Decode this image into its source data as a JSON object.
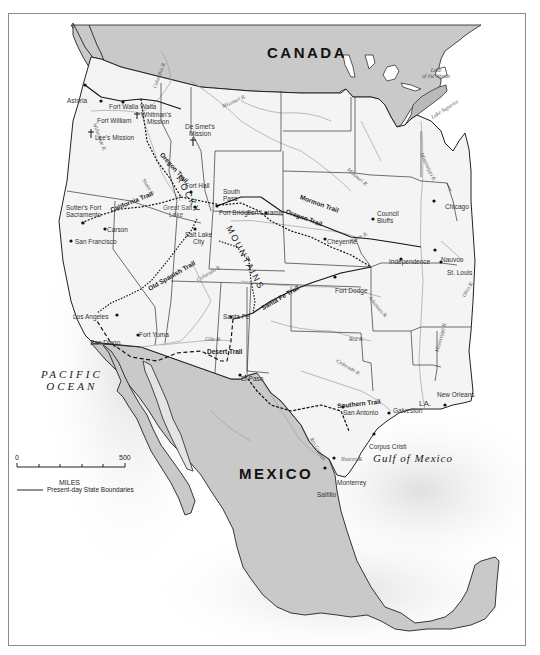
{
  "map": {
    "countries": {
      "canada": "CANADA",
      "mexico": "MEXICO"
    },
    "water_bodies": {
      "pacific_line1": "PACIFIC",
      "pacific_line2": "OCEAN",
      "gulf": "Gulf of Mexico",
      "lake_woods_line1": "Lake",
      "lake_woods_line2": "of the Woods",
      "lake_superior": "Lake Superior"
    },
    "mountain_range": {
      "line1": "ROCKY",
      "line2": "MOUNTAINS"
    },
    "state_labels": {
      "louisiana": "LA."
    },
    "trails": {
      "oregon": "Oregon Trail",
      "california": "California Trail",
      "mormon": "Mormon Trail",
      "old_spanish": "Old Spanish Trail",
      "santa_fe": "Santa Fe Trail",
      "desert": "Desert Trail",
      "southern": "Southern Trail"
    },
    "rivers": {
      "columbia": "Columbia R.",
      "willamette": "Willamette R.",
      "missouri_n": "Missouri R.",
      "missouri_s": "Missouri R.",
      "mississippi_n": "Mississippi R.",
      "mississippi_s": "Mississippi R.",
      "snake": "Snake R.",
      "platte": "Platte R.",
      "colorado": "Colorado R.",
      "gila": "Gila R.",
      "arkansas": "Arkansas R.",
      "red": "Red R.",
      "colorado_tx": "Colorado R.",
      "rio_grande": "Rio Grande",
      "nueces": "Nueces R.",
      "ohio": "Ohio R."
    },
    "places": {
      "astoria": "Astoria",
      "fort_walla_walla": "Fort Walla Walla",
      "whitmans_mission_1": "Whitman's",
      "whitmans_mission_2": "Mission",
      "fort_william": "Fort William",
      "lees_mission": "Lee's Mission",
      "de_smets_mission_1": "De Smet's",
      "de_smets_mission_2": "Mission",
      "fort_hall": "Fort Hall",
      "south_pass_1": "South",
      "south_pass_2": "Pass",
      "sutters_fort_1": "Sutter's Fort",
      "sutters_fort_2": "Sacramento",
      "great_salt_lake_1": "Great Salt",
      "great_salt_lake_2": "Lake",
      "salt_lake_city_1": "Salt Lake",
      "salt_lake_city_2": "City",
      "fort_bridger": "Fort Bridger",
      "fort_laramie": "Fort Laramie",
      "carson": "Carson",
      "san_francisco": "San Francisco",
      "cheyenne": "Cheyenne",
      "council_bluffs_1": "Council",
      "council_bluffs_2": "Bluffs",
      "chicago": "Chicago",
      "nauvoo": "Nauvoo",
      "independence": "Independence",
      "st_louis": "St. Louis",
      "fort_dodge": "Fort Dodge",
      "los_angeles": "Los Angeles",
      "san_diego": "San Diego",
      "fort_yuma": "Fort Yuma",
      "santa_fe": "Santa Fe",
      "el_paso": "El Paso",
      "san_antonio": "San Antonio",
      "galveston": "Galveston",
      "new_orleans": "New Orleans",
      "corpus_christi": "Corpus Cristi",
      "saltillo": "Saltillo",
      "monterrey": "Monterrey"
    },
    "legend": {
      "scale_start": "0",
      "scale_end": "500",
      "scale_unit": "MILES",
      "boundary_label": "Present-day State Boundaries"
    },
    "colors": {
      "foreign_land": "#c9c9c9",
      "us_land": "#f2f2f2",
      "ocean": "#ffffff",
      "boundary": "#222222",
      "river": "#9a9a9a",
      "trail": "#111111"
    }
  }
}
